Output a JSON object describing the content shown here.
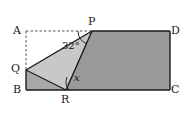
{
  "figure": {
    "background_color": "#ffffff",
    "stroke_color": "#1a1a1a",
    "dash_color": "#555555",
    "fill_dark": "#999999",
    "fill_medium": "#a8a8a8",
    "fill_light": "#c8c8c8"
  },
  "vertices": {
    "A": {
      "label": "A",
      "x": 26,
      "y": 31,
      "label_x": 13,
      "label_y": 25
    },
    "B": {
      "label": "B",
      "x": 26,
      "y": 90,
      "label_x": 13,
      "label_y": 85
    },
    "C": {
      "label": "C",
      "x": 170,
      "y": 90,
      "label_x": 172,
      "label_y": 85
    },
    "D": {
      "label": "D",
      "x": 170,
      "y": 31,
      "label_x": 172,
      "label_y": 25
    },
    "P": {
      "label": "P",
      "x": 92,
      "y": 31,
      "label_x": 88,
      "label_y": 15
    },
    "Q": {
      "label": "Q",
      "x": 26,
      "y": 70,
      "label_x": 12,
      "label_y": 64
    },
    "R": {
      "label": "R",
      "x": 66,
      "y": 90,
      "label_x": 62,
      "label_y": 95
    }
  },
  "angles": {
    "at_p": {
      "value": "32",
      "unit": "°",
      "text": "32°",
      "label_x": 63,
      "label_y": 42
    },
    "at_r": {
      "value": "x",
      "text": "x",
      "label_x": 74,
      "label_y": 74
    }
  },
  "segments": {
    "rectangle": "A-B-C-D",
    "dashed": [
      "A-P",
      "A-Q"
    ],
    "solid": [
      "Q-P",
      "Q-B",
      "B-R",
      "R-P",
      "R-C",
      "C-D",
      "D-P"
    ]
  }
}
